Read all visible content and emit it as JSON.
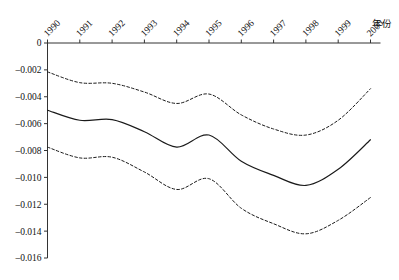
{
  "chart_data": {
    "type": "line",
    "title": "",
    "xlabel": "年份",
    "ylabel": "",
    "grid": false,
    "legend": "none",
    "x": [
      1990,
      1991,
      1992,
      1993,
      1994,
      1995,
      1996,
      1997,
      1998,
      1999,
      2000
    ],
    "categories": [
      "1990",
      "1991",
      "1992",
      "1993",
      "1994",
      "1995",
      "1996",
      "1997",
      "1998",
      "1999",
      "2000"
    ],
    "xlim": [
      1990,
      2000
    ],
    "ylim": [
      -0.016,
      0
    ],
    "yticks": [
      0,
      -0.002,
      -0.004,
      -0.006,
      -0.008,
      -0.01,
      -0.012,
      -0.014,
      -0.016
    ],
    "ytick_labels": [
      "0",
      "–0.002",
      "–0.004",
      "–0.006",
      "–0.008",
      "–0.010",
      "–0.012",
      "–0.014",
      "–0.016"
    ],
    "series": [
      {
        "name": "upper-confidence-bound",
        "style": "dashed",
        "values": [
          -0.00215,
          -0.00295,
          -0.003,
          -0.00365,
          -0.0045,
          -0.0038,
          -0.00535,
          -0.0064,
          -0.00685,
          -0.00575,
          -0.0034
        ]
      },
      {
        "name": "estimate",
        "style": "solid",
        "values": [
          -0.005,
          -0.00575,
          -0.0057,
          -0.0066,
          -0.00775,
          -0.00685,
          -0.0088,
          -0.00985,
          -0.0106,
          -0.0094,
          -0.0072
        ]
      },
      {
        "name": "lower-confidence-bound",
        "style": "dashed",
        "values": [
          -0.00775,
          -0.00855,
          -0.0085,
          -0.0096,
          -0.0109,
          -0.0101,
          -0.0123,
          -0.01345,
          -0.0142,
          -0.0132,
          -0.0115
        ]
      }
    ]
  },
  "style": {
    "line_color": "#1a1a1a",
    "axis_color": "#333333",
    "background": "#ffffff"
  }
}
